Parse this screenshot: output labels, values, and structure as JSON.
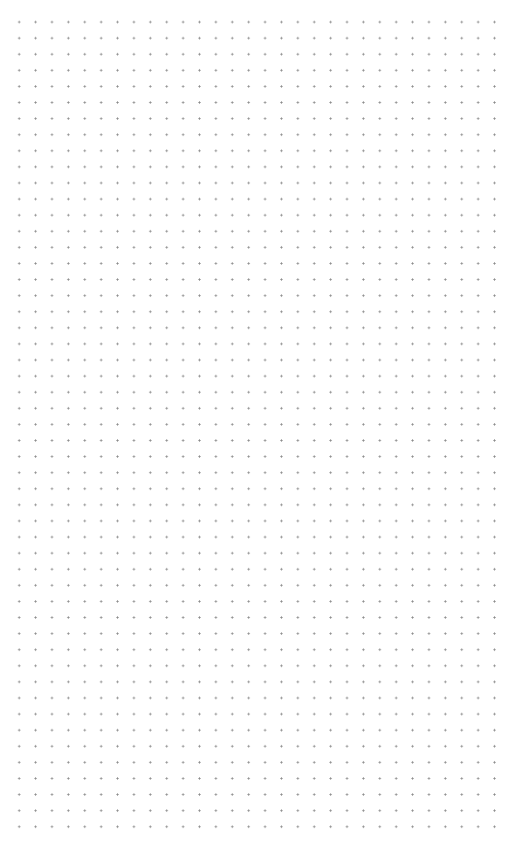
{
  "canvas": {
    "type": "dot-grid",
    "background_color": "#ffffff",
    "dot_color": "#8a8a8a",
    "columns": 30,
    "rows": 51,
    "spacing_x": 16.4,
    "spacing_y": 16.1
  }
}
